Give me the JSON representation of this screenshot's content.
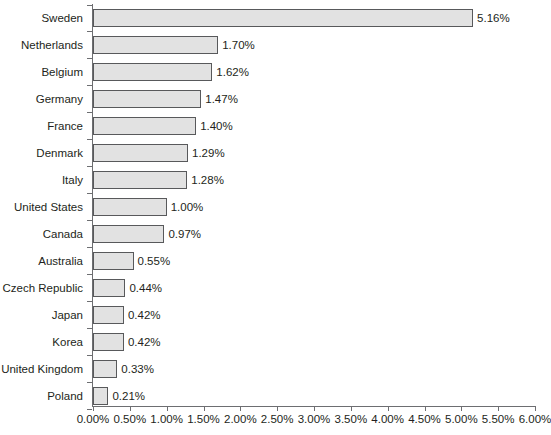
{
  "chart_data": {
    "type": "bar",
    "orientation": "horizontal",
    "title": "",
    "xlabel": "",
    "ylabel": "",
    "xlim": [
      0,
      6
    ],
    "xtick_labels": [
      "0.00%",
      "0.50%",
      "1.00%",
      "1.50%",
      "2.00%",
      "2.50%",
      "3.00%",
      "3.50%",
      "4.00%",
      "4.50%",
      "5.00%",
      "5.50%",
      "6.00%"
    ],
    "xtick_values": [
      0,
      0.5,
      1,
      1.5,
      2,
      2.5,
      3,
      3.5,
      4,
      4.5,
      5,
      5.5,
      6
    ],
    "grid": false,
    "legend": false,
    "categories": [
      "Sweden",
      "Netherlands",
      "Belgium",
      "Germany",
      "France",
      "Denmark",
      "Italy",
      "United States",
      "Canada",
      "Australia",
      "Czech Republic",
      "Japan",
      "Korea",
      "United Kingdom",
      "Poland"
    ],
    "values": [
      5.16,
      1.7,
      1.62,
      1.47,
      1.4,
      1.29,
      1.28,
      1.0,
      0.97,
      0.55,
      0.44,
      0.42,
      0.42,
      0.33,
      0.21
    ],
    "value_labels": [
      "5.16%",
      "1.70%",
      "1.62%",
      "1.47%",
      "1.40%",
      "1.29%",
      "1.28%",
      "1.00%",
      "0.97%",
      "0.55%",
      "0.44%",
      "0.42%",
      "0.42%",
      "0.33%",
      "0.21%"
    ],
    "bar_fill_color": "#e2e2e2",
    "bar_border_color": "#58595b",
    "axis_color": "#6d6e71",
    "text_color": "#231f20"
  }
}
